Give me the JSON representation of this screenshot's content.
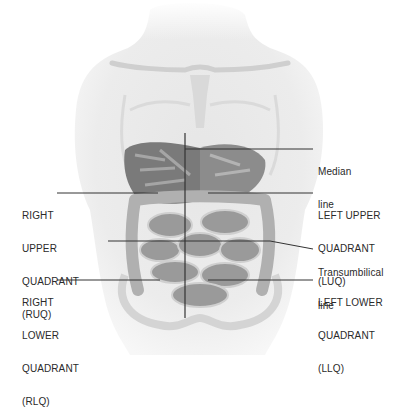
{
  "figure": {
    "labels": {
      "ruq": [
        "RIGHT",
        "UPPER",
        "QUADRANT",
        "(RUQ)"
      ],
      "rlq": [
        "RIGHT",
        "LOWER",
        "QUADRANT",
        "(RLQ)"
      ],
      "median": [
        "Median",
        "line"
      ],
      "luq": [
        "LEFT UPPER",
        "QUADRANT",
        "(LUQ)"
      ],
      "transumbilical": [
        "Transumbilical",
        "line"
      ],
      "llq": [
        "LEFT LOWER",
        "QUADRANT",
        "(LLQ)"
      ]
    }
  }
}
